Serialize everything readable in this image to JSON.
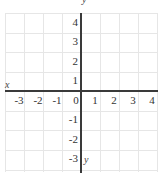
{
  "diagram": {
    "type": "coordinate-plane",
    "x_axis_label": "x",
    "y_axis_label": "y",
    "y_axis_label_top": "y",
    "x_ticks": [
      "-3",
      "-2",
      "-1",
      "0",
      "1",
      "2",
      "3",
      "4"
    ],
    "y_ticks": [
      "4",
      "3",
      "2",
      "1",
      "-1",
      "-2",
      "-3"
    ],
    "x_range": [
      -4,
      4
    ],
    "y_range": [
      -4,
      4
    ],
    "grid": true,
    "colors": {
      "axis": "#3a3a3a",
      "grid": "#e6e6e6",
      "text": "#333333"
    }
  }
}
